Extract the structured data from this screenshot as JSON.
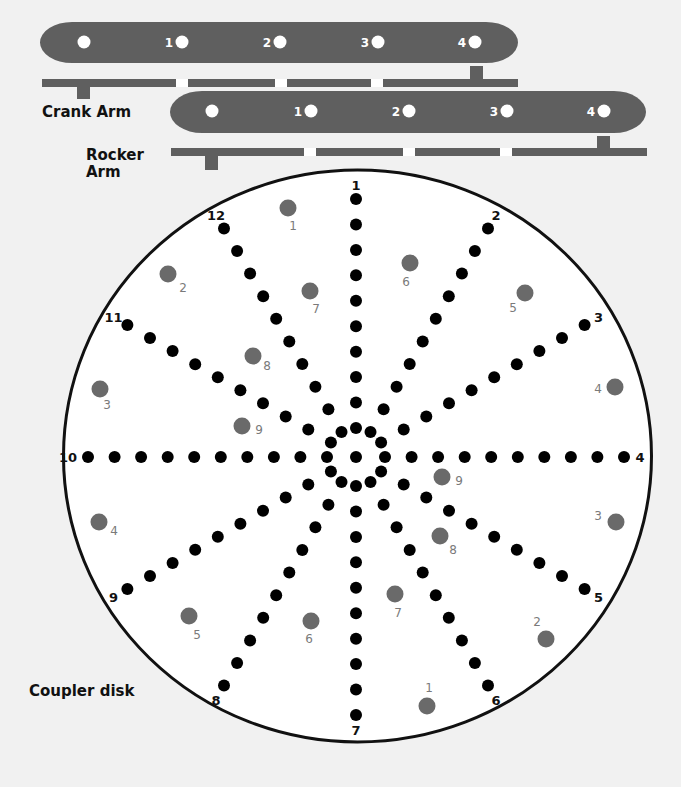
{
  "colors": {
    "background": "#f1f1f1",
    "arm": "#5f5f5f",
    "bar": "#5f5f5f",
    "hole": "#ffffff",
    "disk_fill": "#ffffff",
    "disk_stroke": "#111111",
    "spoke_dot": "#000000",
    "gray_hole": "#6a6a6a",
    "gray_label": "#7a7a7a",
    "label": "#111111"
  },
  "labels": {
    "crank_arm": "Crank Arm",
    "rocker_arm_line1": "Rocker",
    "rocker_arm_line2": "Arm",
    "coupler_disk": "Coupler disk"
  },
  "crank_arm": {
    "holes": [
      {
        "x": 84,
        "label": ""
      },
      {
        "x": 182,
        "label": "1"
      },
      {
        "x": 280,
        "label": "2"
      },
      {
        "x": 378,
        "label": "3"
      },
      {
        "x": 475,
        "label": "4"
      }
    ]
  },
  "rocker_arm": {
    "holes": [
      {
        "x": 212,
        "label": ""
      },
      {
        "x": 311,
        "label": "1"
      },
      {
        "x": 409,
        "label": "2"
      },
      {
        "x": 507,
        "label": "3"
      },
      {
        "x": 604,
        "label": "4"
      }
    ]
  },
  "coupler_disk": {
    "spoke_labels": [
      "1",
      "2",
      "3",
      "4",
      "5",
      "6",
      "7",
      "8",
      "9",
      "10",
      "11",
      "12"
    ],
    "dots_per_spoke": 10,
    "left_holes": [
      {
        "label": "1",
        "x": 288,
        "y": 208,
        "lx": 293,
        "ly": 230
      },
      {
        "label": "2",
        "x": 168,
        "y": 274,
        "lx": 183,
        "ly": 292
      },
      {
        "label": "3",
        "x": 100,
        "y": 389,
        "lx": 107,
        "ly": 409
      },
      {
        "label": "4",
        "x": 99,
        "y": 522,
        "lx": 114,
        "ly": 535
      },
      {
        "label": "5",
        "x": 189,
        "y": 616,
        "lx": 197,
        "ly": 639
      },
      {
        "label": "6",
        "x": 311,
        "y": 621,
        "lx": 309,
        "ly": 643
      },
      {
        "label": "7",
        "x": 310,
        "y": 291,
        "lx": 316,
        "ly": 313
      },
      {
        "label": "8",
        "x": 253,
        "y": 356,
        "lx": 267,
        "ly": 370
      },
      {
        "label": "9",
        "x": 242,
        "y": 426,
        "lx": 259,
        "ly": 434
      }
    ],
    "right_holes": [
      {
        "label": "1",
        "x": 427,
        "y": 706,
        "lx": 429,
        "ly": 692
      },
      {
        "label": "2",
        "x": 546,
        "y": 639,
        "lx": 537,
        "ly": 626
      },
      {
        "label": "3",
        "x": 616,
        "y": 522,
        "lx": 598,
        "ly": 520
      },
      {
        "label": "4",
        "x": 615,
        "y": 387,
        "lx": 598,
        "ly": 393
      },
      {
        "label": "5",
        "x": 525,
        "y": 293,
        "lx": 513,
        "ly": 312
      },
      {
        "label": "6",
        "x": 410,
        "y": 263,
        "lx": 406,
        "ly": 286
      },
      {
        "label": "7",
        "x": 395,
        "y": 594,
        "lx": 398,
        "ly": 617
      },
      {
        "label": "8",
        "x": 440,
        "y": 536,
        "lx": 453,
        "ly": 554
      },
      {
        "label": "9",
        "x": 442,
        "y": 477,
        "lx": 459,
        "ly": 485
      }
    ]
  }
}
